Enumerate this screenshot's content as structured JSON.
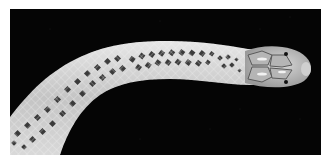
{
  "image": {
    "subject": "snake",
    "alt": "Photograph of a pale snake with a dark diamond blotch pattern and large head plates on a black background",
    "colors": {
      "background": "#050505",
      "border": "#ffffff",
      "body_light": "#d8d8d8",
      "body_mid": "#a9a9a9",
      "blotch": "#2a2a2a",
      "head": "#bdbdbd"
    }
  }
}
